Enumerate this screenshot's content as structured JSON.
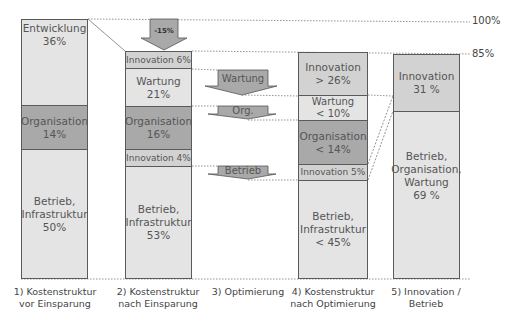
{
  "reference_lines": {
    "top_label": "100%",
    "mid_label": "85%"
  },
  "arrows": {
    "reduction": "-15%",
    "wartung": "Wartung",
    "org": "Org.",
    "betrieb": "Betrieb"
  },
  "columns": [
    {
      "caption": [
        "1) Kostenstruktur",
        "vor Einsparung"
      ],
      "segments": [
        {
          "name": "Entwicklung",
          "value": "36%"
        },
        {
          "name": "Organisation",
          "value": "14%"
        },
        {
          "name": "Betrieb,",
          "name2": "Infrastruktur",
          "value": "50%"
        }
      ]
    },
    {
      "caption": [
        "2) Kostenstruktur",
        "nach Einsparung"
      ],
      "segments": [
        {
          "name": "Innovation 6%"
        },
        {
          "name": "Wartung",
          "value": "21%"
        },
        {
          "name": "Organisation",
          "value": "16%"
        },
        {
          "name": "Innovation 4%"
        },
        {
          "name": "Betrieb,",
          "name2": "Infrastruktur",
          "value": "53%"
        }
      ]
    },
    {
      "caption": [
        "3) Optimierung"
      ]
    },
    {
      "caption": [
        "4) Kostenstruktur",
        "nach Optimierung"
      ],
      "segments": [
        {
          "name": "Innovation",
          "value": "> 26%"
        },
        {
          "name": "Wartung",
          "value": "< 10%"
        },
        {
          "name": "Organisation",
          "value": "< 14%"
        },
        {
          "name": "Innovation 5%"
        },
        {
          "name": "Betrieb,",
          "name2": "Infrastruktur",
          "value": "< 45%"
        }
      ]
    },
    {
      "caption": [
        "5) Innovation /",
        "Betrieb"
      ],
      "segments": [
        {
          "name": "Innovation",
          "value": "31 %"
        },
        {
          "name": "Betrieb,",
          "name2": "Organisation,",
          "name3": "Wartung",
          "value": "69 %"
        }
      ]
    }
  ]
}
